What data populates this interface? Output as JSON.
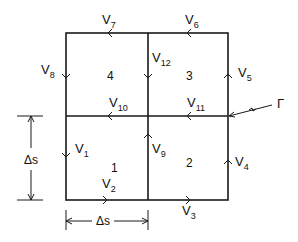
{
  "diagram": {
    "type": "finite-difference grid cells with velocity vectors",
    "cells": [
      {
        "id": "1",
        "label": "1"
      },
      {
        "id": "2",
        "label": "2"
      },
      {
        "id": "3",
        "label": "3"
      },
      {
        "id": "4",
        "label": "4"
      }
    ],
    "velocities": [
      {
        "name": "V",
        "sub": "1",
        "edge": "left-lower",
        "direction": "down"
      },
      {
        "name": "V",
        "sub": "2",
        "edge": "bottom-left",
        "direction": "right"
      },
      {
        "name": "V",
        "sub": "3",
        "edge": "bottom-right",
        "direction": "right"
      },
      {
        "name": "V",
        "sub": "4",
        "edge": "right-lower",
        "direction": "up"
      },
      {
        "name": "V",
        "sub": "5",
        "edge": "right-upper",
        "direction": "up"
      },
      {
        "name": "V",
        "sub": "6",
        "edge": "top-right",
        "direction": "left"
      },
      {
        "name": "V",
        "sub": "7",
        "edge": "top-left",
        "direction": "left"
      },
      {
        "name": "V",
        "sub": "8",
        "edge": "left-upper",
        "direction": "down"
      },
      {
        "name": "V",
        "sub": "9",
        "edge": "center-lower",
        "direction": "up"
      },
      {
        "name": "V",
        "sub": "10",
        "edge": "center-left",
        "direction": "left"
      },
      {
        "name": "V",
        "sub": "11",
        "edge": "center-right",
        "direction": "left"
      },
      {
        "name": "V",
        "sub": "12",
        "edge": "center-upper",
        "direction": "down"
      }
    ],
    "boundary_label": "Γ",
    "dimension_vertical": "Δs",
    "dimension_horizontal": "Δs"
  }
}
